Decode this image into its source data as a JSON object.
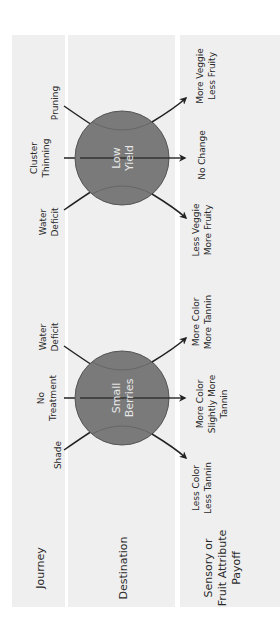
{
  "rows": {
    "journey": "Journey",
    "destination": "Destination",
    "payoff": [
      "Sensory or",
      "Fruit Attribute",
      "Payoff"
    ]
  },
  "groups": [
    {
      "destination": [
        "Small",
        "Berries"
      ],
      "journeys": [
        [
          "Shade"
        ],
        [
          "No",
          "Treatment"
        ],
        [
          "Water",
          "Deficit"
        ]
      ],
      "payoffs": [
        [
          "Less Color",
          "Less Tannin"
        ],
        [
          "More Color",
          "Slightly More",
          "Tannin"
        ],
        [
          "More Color",
          "More Tannin"
        ]
      ]
    },
    {
      "destination": [
        "Low",
        "Yield"
      ],
      "journeys": [
        [
          "Water",
          "Deficit"
        ],
        [
          "Cluster",
          "Thinning"
        ],
        [
          "Pruning"
        ]
      ],
      "payoffs": [
        [
          "Less Veggie",
          "More Fruity"
        ],
        [
          "No Change"
        ],
        [
          "More Veggie",
          "Less Fruity"
        ]
      ]
    }
  ],
  "colors": {
    "background_band": "#efefef",
    "circle_fill": "#7a7a7a",
    "circle_stroke": "#555555",
    "arrow": "#222222",
    "circle_text": "#e8e8e8"
  }
}
